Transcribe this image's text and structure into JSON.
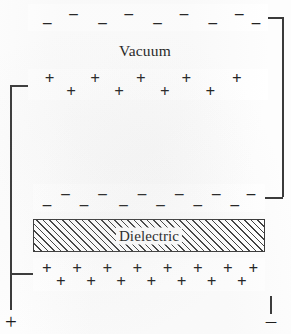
{
  "figure": {
    "labels": {
      "vacuum": "Vacuum",
      "dielectric": "Dielectric"
    },
    "symbols": {
      "minus": "–",
      "plus": "+"
    },
    "terminals": {
      "positive": "+",
      "negative": "–"
    },
    "colors": {
      "ink": "#3a3a3a",
      "text": "#1b1b1b",
      "page": "#fdfdfd",
      "hatch": "#3f3f3f"
    },
    "plates": [
      {
        "name": "top-negative-plate",
        "charge": "negative",
        "x": 28,
        "y": 4,
        "w": 240,
        "h": 27,
        "charge_positions": [
          {
            "cx": 8,
            "cy": 68,
            "sign": "minus"
          },
          {
            "cx": 19,
            "cy": 33,
            "sign": "minus"
          },
          {
            "cx": 31,
            "cy": 68,
            "sign": "minus"
          },
          {
            "cx": 42,
            "cy": 33,
            "sign": "minus"
          },
          {
            "cx": 54,
            "cy": 68,
            "sign": "minus"
          },
          {
            "cx": 65,
            "cy": 33,
            "sign": "minus"
          },
          {
            "cx": 77,
            "cy": 68,
            "sign": "minus"
          },
          {
            "cx": 88,
            "cy": 33,
            "sign": "minus"
          },
          {
            "cx": 95,
            "cy": 68,
            "sign": "minus"
          }
        ]
      },
      {
        "name": "second-positive-plate",
        "charge": "positive",
        "x": 28,
        "y": 69,
        "w": 240,
        "h": 31,
        "charge_positions": [
          {
            "cx": 9,
            "cy": 30,
            "sign": "plus"
          },
          {
            "cx": 18,
            "cy": 70,
            "sign": "plus"
          },
          {
            "cx": 28,
            "cy": 30,
            "sign": "plus"
          },
          {
            "cx": 38,
            "cy": 70,
            "sign": "plus"
          },
          {
            "cx": 47,
            "cy": 30,
            "sign": "plus"
          },
          {
            "cx": 57,
            "cy": 70,
            "sign": "plus"
          },
          {
            "cx": 66,
            "cy": 30,
            "sign": "plus"
          },
          {
            "cx": 76,
            "cy": 70,
            "sign": "plus"
          },
          {
            "cx": 87,
            "cy": 30,
            "sign": "plus"
          }
        ]
      },
      {
        "name": "third-negative-plate",
        "charge": "negative",
        "x": 33,
        "y": 184,
        "w": 232,
        "h": 28,
        "charge_positions": [
          {
            "cx": 6,
            "cy": 70,
            "sign": "minus"
          },
          {
            "cx": 14,
            "cy": 32,
            "sign": "minus"
          },
          {
            "cx": 22,
            "cy": 70,
            "sign": "minus"
          },
          {
            "cx": 30,
            "cy": 32,
            "sign": "minus"
          },
          {
            "cx": 39,
            "cy": 70,
            "sign": "minus"
          },
          {
            "cx": 47,
            "cy": 32,
            "sign": "minus"
          },
          {
            "cx": 55,
            "cy": 70,
            "sign": "minus"
          },
          {
            "cx": 63,
            "cy": 32,
            "sign": "minus"
          },
          {
            "cx": 71,
            "cy": 70,
            "sign": "minus"
          },
          {
            "cx": 79,
            "cy": 32,
            "sign": "minus"
          },
          {
            "cx": 87,
            "cy": 70,
            "sign": "minus"
          },
          {
            "cx": 94,
            "cy": 32,
            "sign": "minus"
          }
        ]
      },
      {
        "name": "bottom-positive-plate",
        "charge": "positive",
        "x": 33,
        "y": 258,
        "w": 232,
        "h": 33,
        "charge_positions": [
          {
            "cx": 6,
            "cy": 31,
            "sign": "plus"
          },
          {
            "cx": 12,
            "cy": 70,
            "sign": "plus"
          },
          {
            "cx": 19,
            "cy": 31,
            "sign": "plus"
          },
          {
            "cx": 25,
            "cy": 70,
            "sign": "plus"
          },
          {
            "cx": 32,
            "cy": 31,
            "sign": "plus"
          },
          {
            "cx": 38,
            "cy": 70,
            "sign": "plus"
          },
          {
            "cx": 45,
            "cy": 31,
            "sign": "plus"
          },
          {
            "cx": 51,
            "cy": 70,
            "sign": "plus"
          },
          {
            "cx": 58,
            "cy": 31,
            "sign": "plus"
          },
          {
            "cx": 64,
            "cy": 70,
            "sign": "plus"
          },
          {
            "cx": 71,
            "cy": 31,
            "sign": "plus"
          },
          {
            "cx": 77,
            "cy": 70,
            "sign": "plus"
          },
          {
            "cx": 84,
            "cy": 31,
            "sign": "plus"
          },
          {
            "cx": 90,
            "cy": 70,
            "sign": "plus"
          },
          {
            "cx": 95,
            "cy": 31,
            "sign": "plus"
          }
        ]
      }
    ],
    "dielectric_block": {
      "x": 33,
      "y": 219,
      "w": 232,
      "h": 33
    },
    "vacuum_label_pos": {
      "x": 145,
      "y": 51
    },
    "wires": [
      {
        "name": "wire-top-right-stub",
        "type": "h",
        "x": 268,
        "y": 17,
        "len": 16
      },
      {
        "name": "wire-right-vertical",
        "type": "v",
        "x": 282,
        "y": 17,
        "len": 180
      },
      {
        "name": "wire-right-to-plate3",
        "type": "h",
        "x": 265,
        "y": 197,
        "len": 18
      },
      {
        "name": "wire-left-stub-plate2",
        "type": "h",
        "x": 10,
        "y": 85,
        "len": 19
      },
      {
        "name": "wire-left-vertical",
        "type": "v",
        "x": 10,
        "y": 85,
        "len": 225
      },
      {
        "name": "wire-left-to-plate4",
        "type": "h",
        "x": 10,
        "y": 273,
        "len": 24
      },
      {
        "name": "wire-right-terminal-v",
        "type": "v",
        "x": 270,
        "y": 296,
        "len": 18
      }
    ],
    "terminal_positions": {
      "positive": {
        "x": 11,
        "y": 322
      },
      "negative": {
        "x": 271,
        "y": 321
      }
    }
  }
}
